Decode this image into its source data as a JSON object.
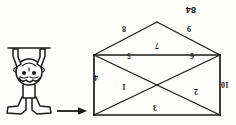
{
  "page": {
    "background_color": "#fdfdfb",
    "ink_color": "#1a1a1a",
    "orientation": "upside-down",
    "caption": "84"
  },
  "figure": {
    "name": "rectangle-with-diagonals-and-triangle",
    "labels": [
      {
        "id": "label-3",
        "text": "3",
        "edge": "top",
        "x": 79,
        "y": 14
      },
      {
        "id": "label-10",
        "text": "10",
        "edge": "left",
        "x": 7,
        "y": 37
      },
      {
        "id": "label-4",
        "text": "4",
        "edge": "right",
        "x": 138,
        "y": 44
      },
      {
        "id": "label-2",
        "text": "2",
        "edge": "diagonal-upper-left",
        "x": 38,
        "y": 30
      },
      {
        "id": "label-1",
        "text": "1",
        "edge": "diagonal-upper-right",
        "x": 110,
        "y": 35
      },
      {
        "id": "label-6a",
        "text": "6",
        "edge": "diagonal-lower-left",
        "x": 42,
        "y": 66
      },
      {
        "id": "label-5",
        "text": "5",
        "edge": "diagonal-lower-right",
        "x": 105,
        "y": 66
      },
      {
        "id": "label-7",
        "text": "7",
        "edge": "bottom",
        "x": 77,
        "y": 76
      },
      {
        "id": "label-9",
        "text": "9",
        "edge": "triangle-left",
        "x": 45,
        "y": 93
      },
      {
        "id": "label-8",
        "text": "8",
        "edge": "triangle-right",
        "x": 110,
        "y": 93
      }
    ]
  },
  "arrow": {
    "name": "left-pointing-arrow",
    "direction": "left",
    "x": 148,
    "y": 12
  },
  "illustration": {
    "name": "boy-doing-handstand",
    "description": "Cartoon boy standing on his hands, shown upside-down",
    "x": 182,
    "y": 8
  }
}
